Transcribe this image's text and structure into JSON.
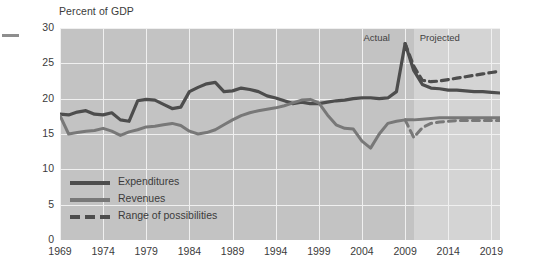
{
  "chart_data": {
    "type": "line",
    "title": "",
    "ylabel": "Percent of GDP",
    "xlabel": "",
    "ylim": [
      0,
      30
    ],
    "yticks": [
      0,
      5,
      10,
      15,
      20,
      25,
      30
    ],
    "xlim": [
      1969,
      2020
    ],
    "xticks": [
      1969,
      1974,
      1979,
      1984,
      1989,
      1994,
      1999,
      2004,
      2009,
      2014,
      2019
    ],
    "grid": true,
    "legend_position": "inside-lower-left",
    "annotations": [
      {
        "text": "Actual",
        "x": 2006.5,
        "y": 28.6
      },
      {
        "text": "Projected",
        "x": 2010.7,
        "y": 28.6
      }
    ],
    "shaded_region": {
      "label": "Projected",
      "x_start": 2010,
      "x_end": 2020
    },
    "x": [
      1969,
      1970,
      1971,
      1972,
      1973,
      1974,
      1975,
      1976,
      1977,
      1978,
      1979,
      1980,
      1981,
      1982,
      1983,
      1984,
      1985,
      1986,
      1987,
      1988,
      1989,
      1990,
      1991,
      1992,
      1993,
      1994,
      1995,
      1996,
      1997,
      1998,
      1999,
      2000,
      2001,
      2002,
      2003,
      2004,
      2005,
      2006,
      2007,
      2008,
      2009,
      2010,
      2011,
      2012,
      2013,
      2014,
      2015,
      2016,
      2017,
      2018,
      2019,
      2020
    ],
    "series": [
      {
        "name": "Expenditures",
        "color": "#4d4d4d",
        "style": "solid",
        "values": [
          17.8,
          17.7,
          18.1,
          18.3,
          17.8,
          17.7,
          18.0,
          17.0,
          16.8,
          19.7,
          19.9,
          19.8,
          19.2,
          18.6,
          18.8,
          21.0,
          21.6,
          22.1,
          22.3,
          21.0,
          21.1,
          21.5,
          21.3,
          21.0,
          20.4,
          20.1,
          19.7,
          19.3,
          19.5,
          19.3,
          19.3,
          19.5,
          19.7,
          19.8,
          20.0,
          20.1,
          20.1,
          20.0,
          20.1,
          21.0,
          27.8,
          24.0,
          22.0,
          21.5,
          21.4,
          21.2,
          21.2,
          21.1,
          21.0,
          21.0,
          20.9,
          20.8
        ]
      },
      {
        "name": "Revenues",
        "color": "#787878",
        "style": "solid",
        "values": [
          17.6,
          15.0,
          15.2,
          15.4,
          15.5,
          15.8,
          15.4,
          14.8,
          15.3,
          15.6,
          16.0,
          16.1,
          16.3,
          16.5,
          16.2,
          15.4,
          15.0,
          15.2,
          15.6,
          16.3,
          17.0,
          17.6,
          18.0,
          18.3,
          18.5,
          18.7,
          19.0,
          19.4,
          19.8,
          19.9,
          19.4,
          17.7,
          16.3,
          15.8,
          15.7,
          14.0,
          13.0,
          15.0,
          16.5,
          16.8,
          17.0,
          17.0,
          17.1,
          17.2,
          17.3,
          17.3,
          17.3,
          17.3,
          17.3,
          17.3,
          17.3,
          17.3
        ]
      },
      {
        "name": "Range of possibilities",
        "color": "#4d4d4d",
        "style": "dashed",
        "upper": [
          27.8,
          24.6,
          22.6,
          22.4,
          22.5,
          22.7,
          22.9,
          23.1,
          23.3,
          23.5,
          23.7,
          23.9
        ],
        "lower": [
          17.0,
          14.5,
          15.9,
          16.5,
          16.7,
          16.8,
          16.9,
          16.9,
          16.9,
          16.9,
          16.9,
          16.9
        ],
        "upper_x": [
          2009,
          2010,
          2011,
          2012,
          2013,
          2014,
          2015,
          2016,
          2017,
          2018,
          2019,
          2020
        ],
        "lower_x": [
          2009,
          2010,
          2011,
          2012,
          2013,
          2014,
          2015,
          2016,
          2017,
          2018,
          2019,
          2020
        ]
      }
    ],
    "legend": [
      {
        "label": "Expenditures",
        "key": "solid-dark"
      },
      {
        "label": "Revenues",
        "key": "solid-mid"
      },
      {
        "label": "Range of possibilities",
        "key": "dashed-dark"
      }
    ],
    "colors": {
      "plot_background": "#c3c3c3",
      "projected_background": "#d4d4d4",
      "gridline": "#f0f0f0",
      "expenditures": "#4d4d4d",
      "revenues": "#787878",
      "text": "#3b3b3b",
      "page_background": "#ffffff"
    }
  }
}
